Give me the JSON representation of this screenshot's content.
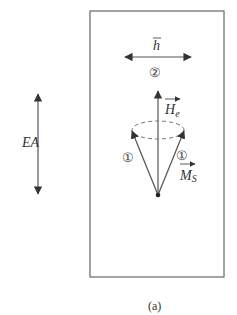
{
  "figure": {
    "caption": "(a)",
    "colors": {
      "line": "#555555",
      "dashed": "#777777",
      "text": "#333333"
    }
  },
  "labels": {
    "easy_axis": "EA",
    "field_h": "h",
    "field_He": "H",
    "field_He_sub": "e",
    "magnetization": "M",
    "magnetization_sub": "S",
    "marker_left": "①",
    "marker_right": "①",
    "marker_h": "②"
  }
}
